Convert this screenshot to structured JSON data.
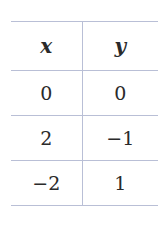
{
  "table": {
    "headers": [
      "x",
      "y"
    ],
    "rows": [
      [
        "0",
        "0"
      ],
      [
        "2",
        "−1"
      ],
      [
        "−2",
        "1"
      ]
    ]
  },
  "colors": {
    "rule": "#b9bfd6",
    "text": "#2a2a2a"
  }
}
